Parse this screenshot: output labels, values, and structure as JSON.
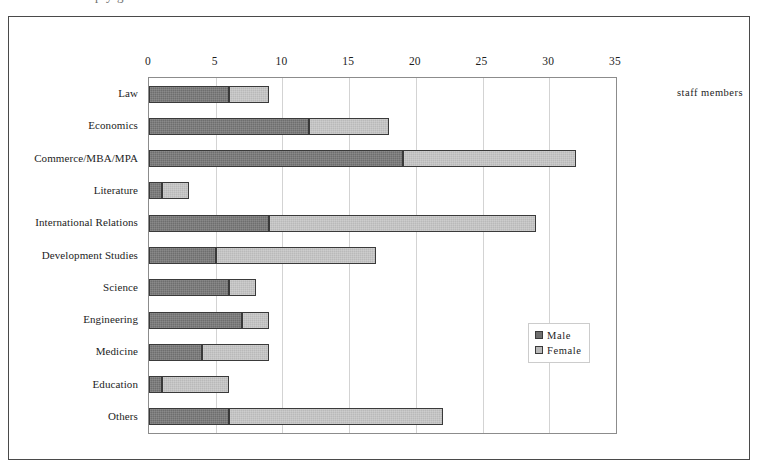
{
  "cut_off_caption": "p                        y                        g",
  "unit_caption": "staff members",
  "legend": {
    "position": "inside-right",
    "items": [
      {
        "name": "male-legend-entry",
        "label": "Male",
        "color": "#6e6e6e"
      },
      {
        "name": "female-legend-entry",
        "label": "Female",
        "color": "#b9b9b9"
      }
    ]
  },
  "chart_data": {
    "type": "bar",
    "orientation": "horizontal",
    "stacked": true,
    "title": "",
    "subtitle": "",
    "xlabel": "staff members",
    "ylabel": "",
    "xlim": [
      0,
      35
    ],
    "xticks": [
      0,
      5,
      10,
      15,
      20,
      25,
      30,
      35
    ],
    "xtick_labels": [
      "0",
      "5",
      "10",
      "15",
      "20",
      "25",
      "30",
      "35"
    ],
    "grid": "vertical",
    "legend_position": "inside-right",
    "categories": [
      "Law",
      "Economics",
      "Commerce/MBA/MPA",
      "Literature",
      "International Relations",
      "Development Studies",
      "Science",
      "Engineering",
      "Medicine",
      "Education",
      "Others"
    ],
    "series": [
      {
        "name": "Male",
        "color": "#6e6e6e",
        "values": [
          6,
          12,
          19,
          1,
          9,
          5,
          6,
          7,
          4,
          1,
          6
        ]
      },
      {
        "name": "Female",
        "color": "#b9b9b9",
        "values": [
          3,
          6,
          13,
          2,
          20,
          12,
          2,
          2,
          5,
          5,
          16
        ]
      }
    ],
    "totals": [
      9,
      18,
      32,
      3,
      29,
      17,
      8,
      9,
      9,
      6,
      22
    ]
  }
}
